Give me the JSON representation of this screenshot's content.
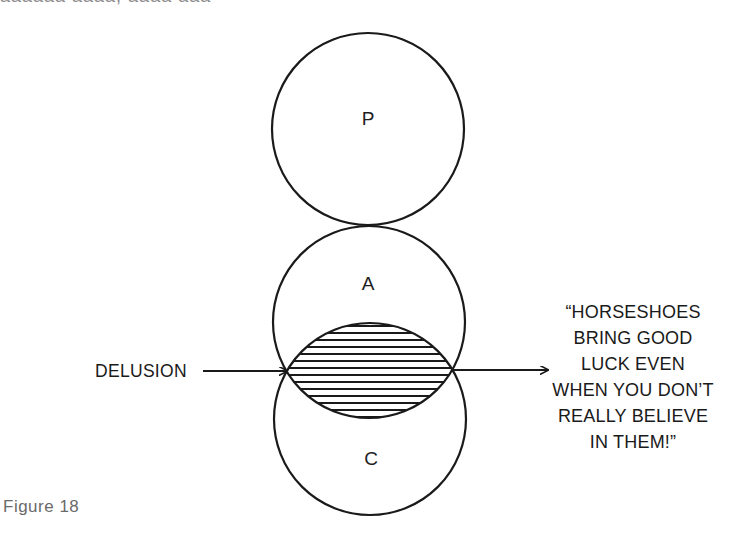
{
  "top_fragment": {
    "text": "aaaaaa   aaaa,  aaaa aaa"
  },
  "diagram": {
    "circles": [
      {
        "id": "P",
        "label": "P",
        "cx": 368,
        "cy": 129,
        "r": 96
      },
      {
        "id": "A",
        "label": "A",
        "cx": 369,
        "cy": 322,
        "r": 96
      },
      {
        "id": "C",
        "label": "C",
        "cx": 370,
        "cy": 419,
        "r": 96
      }
    ],
    "overlap": {
      "between": [
        "A",
        "C"
      ],
      "fill": "horizontal-hatching",
      "hatch_spacing": 7
    },
    "left_pointer": {
      "label": "DELUSION",
      "arrow_from_x": 203,
      "arrow_to_x": 287,
      "y": 371
    },
    "right_pointer": {
      "arrow_from_x": 452,
      "arrow_to_x": 548,
      "y": 370,
      "quote_lines": [
        "“HORSESHOES",
        "BRING GOOD",
        "LUCK EVEN",
        "WHEN YOU DON’T",
        "REALLY BELIEVE",
        "IN THEM!”"
      ]
    },
    "stroke_color": "#1a1a1a"
  },
  "caption": {
    "text": "Figure 18"
  }
}
